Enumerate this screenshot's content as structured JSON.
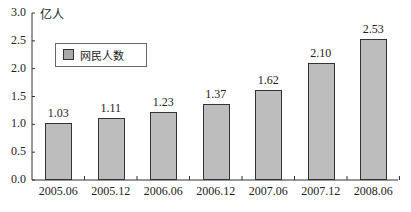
{
  "chart_data": {
    "type": "bar",
    "title": "",
    "xlabel": "",
    "ylabel": "亿人",
    "categories": [
      "2005.06",
      "2005.12",
      "2006.06",
      "2006.12",
      "2007.06",
      "2007.12",
      "2008.06"
    ],
    "series": [
      {
        "name": "网民人数",
        "values": [
          1.03,
          1.11,
          1.23,
          1.37,
          1.62,
          2.1,
          2.53
        ]
      }
    ],
    "value_labels": [
      "1.03",
      "1.11",
      "1.23",
      "1.37",
      "1.62",
      "2.10",
      "2.53"
    ],
    "ylim": [
      0,
      3.0
    ],
    "yticks": [
      "0.0",
      "0.5",
      "1.0",
      "1.5",
      "2.0",
      "2.5",
      "3.0"
    ],
    "grid": false,
    "legend_position": "upper-left",
    "bar_color": "#bdbdbd"
  },
  "legend": {
    "label": "网民人数"
  },
  "unit_label": "亿人"
}
